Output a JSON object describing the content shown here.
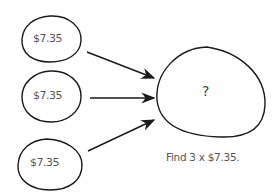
{
  "diagram": {
    "inputs": [
      {
        "label": "$7.35"
      },
      {
        "label": "$7.35"
      },
      {
        "label": "$7.35"
      }
    ],
    "result": {
      "label": "?"
    },
    "caption": "Find 3 x $7.35.",
    "colors": {
      "stroke": "#1a1a1a",
      "text": "#555555",
      "background": "#ffffff"
    }
  }
}
